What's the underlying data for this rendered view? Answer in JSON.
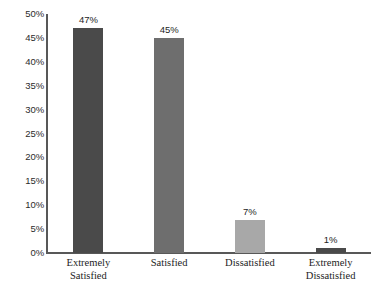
{
  "chart_data": {
    "type": "bar",
    "title": "",
    "subtitle": "",
    "xlabel": "",
    "ylabel": "",
    "categories": [
      "Extremely Satisfied",
      "Satisfied",
      "Dissatisfied",
      "Extremely Dissatisfied"
    ],
    "category_lines": [
      [
        "Extremely",
        "Satisfied"
      ],
      [
        "Satisfied"
      ],
      [
        "Dissatisfied"
      ],
      [
        "Extremely",
        "Dissatisfied"
      ]
    ],
    "values": [
      47,
      45,
      7,
      1
    ],
    "value_labels": [
      "47%",
      "45%",
      "7%",
      "1%"
    ],
    "bar_colors": [
      "#4a4a4a",
      "#6e6e6e",
      "#a8a8a8",
      "#4a4a4a"
    ],
    "ylim": [
      0,
      50
    ],
    "ytick_values": [
      0,
      5,
      10,
      15,
      20,
      25,
      30,
      35,
      40,
      45,
      50
    ],
    "ytick_labels": [
      "0%",
      "5%",
      "10%",
      "15%",
      "20%",
      "25%",
      "30%",
      "35%",
      "40%",
      "45%",
      "50%"
    ],
    "grid": false,
    "legend": false,
    "legend_position": "none",
    "axis_color": "#585858",
    "background_color": "#ffffff"
  }
}
